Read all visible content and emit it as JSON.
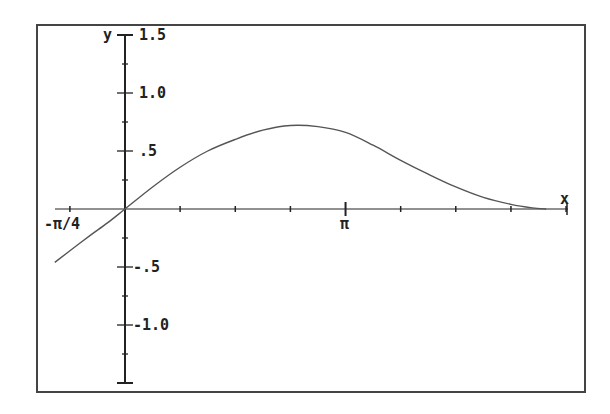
{
  "chart_data": {
    "type": "line",
    "title": "",
    "xlabel": "x",
    "ylabel": "y",
    "xlim": [
      -1.0,
      6.283
    ],
    "ylim": [
      -1.5,
      1.5
    ],
    "grid": false,
    "legend": null,
    "x_ticks": [
      -0.785,
      0,
      0.785,
      1.571,
      2.356,
      3.1416,
      3.927,
      4.712,
      5.498,
      6.283
    ],
    "x_tick_labels": [
      {
        "value": -0.785,
        "label": "-π/4"
      },
      {
        "value": 3.1416,
        "label": "π"
      }
    ],
    "y_ticks": [
      -1.5,
      -1.25,
      -1.0,
      -0.75,
      -0.5,
      -0.25,
      0,
      0.25,
      0.5,
      0.75,
      1.0,
      1.25,
      1.5
    ],
    "y_tick_labels": [
      {
        "value": 1.5,
        "label": "1.5"
      },
      {
        "value": 1.0,
        "label": "1.0"
      },
      {
        "value": 0.5,
        "label": ".5"
      },
      {
        "value": -0.5,
        "label": "-.5"
      },
      {
        "value": -1.0,
        "label": "-1.0"
      }
    ],
    "series": [
      {
        "name": "f(x)",
        "x": [
          -1.0,
          -0.785,
          -0.5,
          -0.25,
          0,
          0.393,
          0.785,
          1.178,
          1.571,
          1.963,
          2.356,
          2.749,
          3.1416,
          3.534,
          3.927,
          4.32,
          4.712,
          5.105,
          5.498,
          5.8,
          6.0
        ],
        "y": [
          -0.46,
          -0.36,
          -0.23,
          -0.12,
          0,
          0.19,
          0.36,
          0.5,
          0.6,
          0.68,
          0.72,
          0.71,
          0.66,
          0.55,
          0.42,
          0.3,
          0.19,
          0.1,
          0.04,
          0.01,
          0.0
        ]
      }
    ]
  },
  "labels": {
    "x_axis": "x",
    "y_axis": "y",
    "y_1_5": "1.5",
    "y_1_0": "1.0",
    "y_0_5": ".5",
    "y_m0_5": "-.5",
    "y_m1_0": "-1.0",
    "x_mpi4": "-π/4",
    "x_pi": "π"
  },
  "colors": {
    "frame": "#444444",
    "axis": "#222222",
    "curve": "#555555",
    "background": "#ffffff"
  }
}
